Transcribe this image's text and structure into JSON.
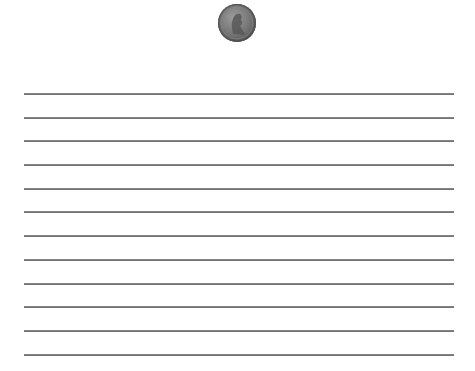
{
  "coin": {
    "icon": "penny-coin-icon",
    "color": "#7a7a7a"
  },
  "writing_lines": {
    "count": 12,
    "color": "#777777",
    "positions_y": [
      94,
      118,
      141,
      165,
      189,
      212,
      236,
      260,
      284,
      307,
      331,
      355
    ]
  }
}
